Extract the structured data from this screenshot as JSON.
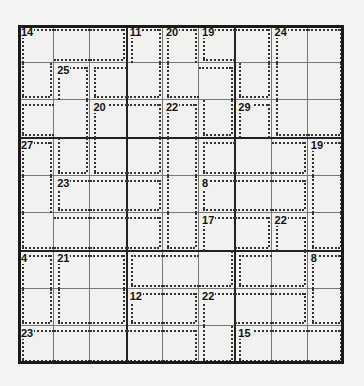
{
  "puzzle": {
    "type": "killer-sudoku",
    "size": 9,
    "colors": {
      "grid": "#222222",
      "cage": "#333333",
      "background": "#f1f1ef"
    },
    "cages": [
      {
        "sum": "14",
        "cells": [
          [
            0,
            0
          ],
          [
            0,
            1
          ],
          [
            0,
            2
          ],
          [
            1,
            0
          ]
        ]
      },
      {
        "sum": "11",
        "cells": [
          [
            0,
            3
          ],
          [
            1,
            3
          ],
          [
            1,
            2
          ]
        ]
      },
      {
        "sum": "20",
        "cells": [
          [
            0,
            4
          ],
          [
            1,
            4
          ],
          [
            1,
            5
          ],
          [
            2,
            5
          ]
        ]
      },
      {
        "sum": "19",
        "cells": [
          [
            0,
            5
          ],
          [
            0,
            6
          ],
          [
            1,
            6
          ]
        ]
      },
      {
        "sum": "24",
        "cells": [
          [
            0,
            7
          ],
          [
            0,
            8
          ],
          [
            1,
            7
          ],
          [
            1,
            8
          ],
          [
            2,
            7
          ],
          [
            2,
            8
          ]
        ]
      },
      {
        "sum": "25",
        "cells": [
          [
            1,
            1
          ],
          [
            2,
            0
          ],
          [
            2,
            1
          ],
          [
            3,
            1
          ]
        ]
      },
      {
        "sum": "20",
        "cells": [
          [
            2,
            2
          ],
          [
            2,
            3
          ],
          [
            3,
            2
          ],
          [
            3,
            3
          ]
        ]
      },
      {
        "sum": "22",
        "cells": [
          [
            2,
            4
          ],
          [
            3,
            4
          ],
          [
            4,
            4
          ],
          [
            5,
            4
          ]
        ]
      },
      {
        "sum": "29",
        "cells": [
          [
            2,
            6
          ],
          [
            3,
            5
          ],
          [
            3,
            6
          ],
          [
            3,
            7
          ]
        ]
      },
      {
        "sum": "27",
        "cells": [
          [
            3,
            0
          ],
          [
            4,
            0
          ],
          [
            5,
            0
          ],
          [
            5,
            1
          ],
          [
            5,
            2
          ],
          [
            5,
            3
          ]
        ]
      },
      {
        "sum": "19",
        "cells": [
          [
            3,
            8
          ],
          [
            4,
            8
          ],
          [
            5,
            8
          ]
        ]
      },
      {
        "sum": "23",
        "cells": [
          [
            4,
            1
          ],
          [
            4,
            2
          ],
          [
            4,
            3
          ]
        ]
      },
      {
        "sum": "8",
        "cells": [
          [
            4,
            5
          ],
          [
            4,
            6
          ],
          [
            4,
            7
          ]
        ]
      },
      {
        "sum": "17",
        "cells": [
          [
            5,
            5
          ],
          [
            5,
            6
          ],
          [
            6,
            3
          ],
          [
            6,
            4
          ],
          [
            6,
            5
          ]
        ]
      },
      {
        "sum": "22",
        "cells": [
          [
            5,
            7
          ],
          [
            6,
            6
          ],
          [
            6,
            7
          ]
        ]
      },
      {
        "sum": "4",
        "cells": [
          [
            6,
            0
          ],
          [
            7,
            0
          ]
        ]
      },
      {
        "sum": "21",
        "cells": [
          [
            6,
            1
          ],
          [
            6,
            2
          ],
          [
            7,
            1
          ],
          [
            7,
            2
          ]
        ]
      },
      {
        "sum": "8",
        "cells": [
          [
            6,
            8
          ],
          [
            7,
            8
          ]
        ]
      },
      {
        "sum": "12",
        "cells": [
          [
            7,
            3
          ],
          [
            7,
            4
          ]
        ]
      },
      {
        "sum": "22",
        "cells": [
          [
            7,
            5
          ],
          [
            7,
            6
          ],
          [
            7,
            7
          ],
          [
            8,
            5
          ]
        ]
      },
      {
        "sum": "23",
        "cells": [
          [
            8,
            0
          ],
          [
            8,
            1
          ],
          [
            8,
            2
          ],
          [
            8,
            3
          ],
          [
            8,
            4
          ]
        ]
      },
      {
        "sum": "15",
        "cells": [
          [
            8,
            6
          ],
          [
            8,
            7
          ],
          [
            8,
            8
          ]
        ]
      }
    ],
    "values": [
      [
        "",
        "",
        "",
        "",
        "",
        "",
        "",
        "",
        ""
      ],
      [
        "",
        "",
        "",
        "",
        "",
        "",
        "",
        "",
        ""
      ],
      [
        "",
        "",
        "",
        "",
        "",
        "",
        "",
        "",
        ""
      ],
      [
        "",
        "",
        "",
        "",
        "",
        "",
        "",
        "",
        ""
      ],
      [
        "",
        "",
        "",
        "",
        "",
        "",
        "",
        "",
        ""
      ],
      [
        "",
        "",
        "",
        "",
        "",
        "",
        "",
        "",
        ""
      ],
      [
        "",
        "",
        "",
        "",
        "",
        "",
        "",
        "",
        ""
      ],
      [
        "",
        "",
        "",
        "",
        "",
        "",
        "",
        "",
        ""
      ],
      [
        "",
        "",
        "",
        "",
        "",
        "",
        "",
        "",
        ""
      ]
    ]
  }
}
